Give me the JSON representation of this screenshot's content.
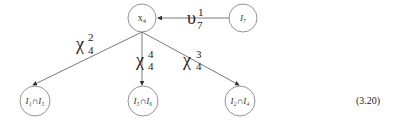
{
  "diagram": {
    "type": "tree",
    "nodes": [
      {
        "id": "x4",
        "label": "x₄",
        "cx": 142,
        "cy": 18,
        "r": 14
      },
      {
        "id": "I7",
        "label": "I₇",
        "cx": 243,
        "cy": 18,
        "r": 14
      },
      {
        "id": "I1nI3",
        "label": "I₁∩I₃",
        "cx": 35,
        "cy": 101,
        "r": 15
      },
      {
        "id": "I5nI6",
        "label": "I₅∩I₆",
        "cx": 143,
        "cy": 101,
        "r": 15
      },
      {
        "id": "I2nI4",
        "label": "I₂∩I₄",
        "cx": 240,
        "cy": 101,
        "r": 15
      }
    ],
    "edges": [
      {
        "from": "I7",
        "to": "x4",
        "label_base": "υ",
        "label_sub": "7",
        "label_sup": "1"
      },
      {
        "from": "x4",
        "to": "I1nI3",
        "label_base": "χ",
        "label_sub": "4",
        "label_sup": "2"
      },
      {
        "from": "x4",
        "to": "I5nI6",
        "label_base": "χ",
        "label_sub": "4",
        "label_sup": "4"
      },
      {
        "from": "x4",
        "to": "I2nI4",
        "label_base": "χ",
        "label_sub": "4",
        "label_sup": "3"
      }
    ]
  },
  "equation_number": "(3.20)"
}
